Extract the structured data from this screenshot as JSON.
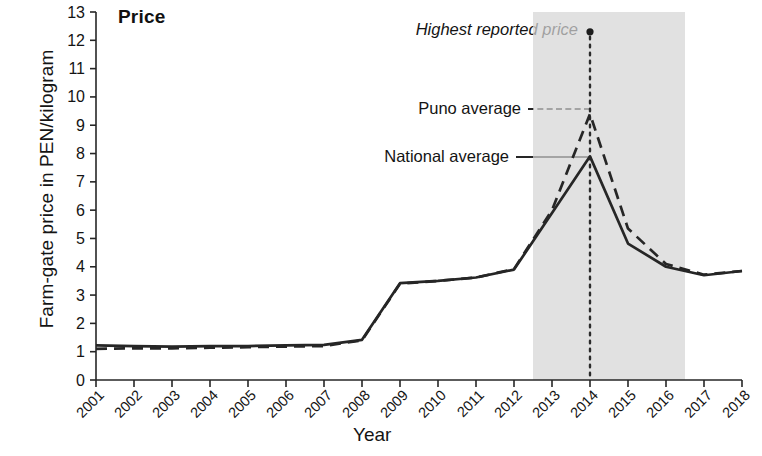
{
  "chart_data": {
    "type": "line",
    "title": "Price",
    "xlabel": "Year",
    "ylabel": "Farm-gate price in PEN/kilogram",
    "x": [
      2001,
      2002,
      2003,
      2004,
      2005,
      2006,
      2007,
      2008,
      2009,
      2010,
      2011,
      2012,
      2013,
      2014,
      2015,
      2016,
      2017,
      2018
    ],
    "xtick_labels": [
      "2001",
      "2002",
      "2003",
      "2004",
      "2005",
      "2006",
      "2007",
      "2008",
      "2009",
      "2010",
      "2011",
      "2012",
      "2013",
      "2014",
      "2015",
      "2016",
      "2017",
      "2018"
    ],
    "ytick_labels": [
      "0",
      "1",
      "2",
      "3",
      "4",
      "5",
      "6",
      "7",
      "8",
      "9",
      "10",
      "11",
      "12",
      "13"
    ],
    "ylim": [
      0,
      13
    ],
    "xlim": [
      2001,
      2018
    ],
    "grid": false,
    "legend_position": "inside-left-of-peak",
    "series": [
      {
        "name": "National average",
        "style": "solid",
        "color": "#262626",
        "values": [
          1.22,
          1.2,
          1.18,
          1.2,
          1.2,
          1.22,
          1.24,
          1.42,
          3.42,
          3.5,
          3.62,
          3.9,
          5.9,
          7.9,
          4.82,
          4.0,
          3.7,
          3.85
        ]
      },
      {
        "name": "Puno average",
        "style": "dashed",
        "color": "#262626",
        "values": [
          1.1,
          1.12,
          1.12,
          1.14,
          1.16,
          1.18,
          1.2,
          1.4,
          3.4,
          3.5,
          3.62,
          3.92,
          6.0,
          9.4,
          5.35,
          4.1,
          3.72,
          3.85
        ]
      }
    ],
    "annotations": [
      {
        "name": "highest-reported-price",
        "label": "Highest reported price",
        "style": "italic",
        "x": 2014,
        "y": 12.3,
        "marker": "dot",
        "connector": "dotted-vertical"
      }
    ],
    "shaded_band": {
      "name": "boom-period",
      "x_start": 2012.5,
      "x_end": 2016.5,
      "color": "#d6d6d6"
    }
  }
}
